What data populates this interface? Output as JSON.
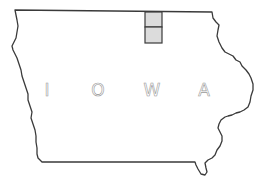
{
  "map": {
    "state_name": "IOWA",
    "letters": [
      {
        "char": "I",
        "x": 47,
        "y": 96
      },
      {
        "char": "O",
        "x": 98,
        "y": 96
      },
      {
        "char": "W",
        "x": 152,
        "y": 96
      },
      {
        "char": "A",
        "x": 204,
        "y": 96
      }
    ],
    "highlighted_regions": [
      {
        "name": "north-square",
        "x": 145,
        "y": 12,
        "w": 17,
        "h": 15
      },
      {
        "name": "south-square",
        "x": 145,
        "y": 27,
        "w": 17,
        "h": 16
      }
    ],
    "colors": {
      "outline": "#3a3a3a",
      "highlight_fill": "#dcdcdc",
      "letters": "#9a9a9a",
      "background": "#ffffff"
    }
  }
}
